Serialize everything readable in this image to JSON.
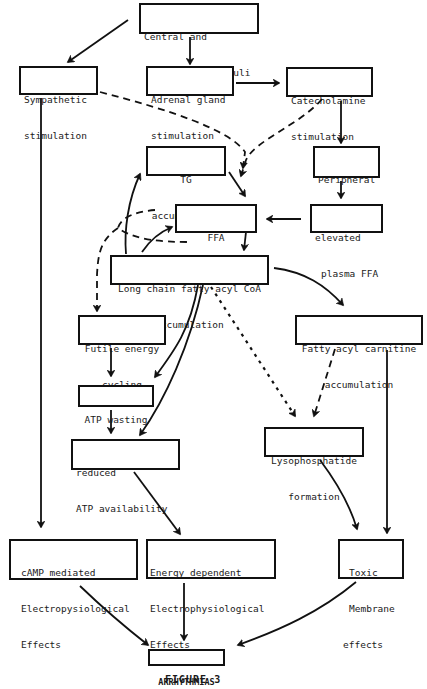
{
  "diagram": {
    "nodes": {
      "central": {
        "line1": "Central and",
        "line2": "Neurogenic Stimuli"
      },
      "sympathetic": {
        "line1": "Sympathetic",
        "line2": "stimulation"
      },
      "adrenal": {
        "line1": "Adrenal gland",
        "line2": "stimulation"
      },
      "catecholamine": {
        "line1": "Catecholamine",
        "line2": "stimulation"
      },
      "tg": {
        "line1": "TG",
        "line2": "accumulation"
      },
      "peripheral": {
        "line1": "Peripheral",
        "line2": "lipolysis"
      },
      "ffa": {
        "line1": "FFA",
        "line2": "accumulation"
      },
      "plasma_ffa": {
        "line1": "elevated",
        "line2": "plasma FFA"
      },
      "long_chain": {
        "line1": "Long chain fatty acyl CoA",
        "line2": "accumulation"
      },
      "futile": {
        "line1": "Futile energy",
        "line2": "cycling"
      },
      "carnitine": {
        "line1": "Fatty acyl carnitine",
        "line2": "accumulation"
      },
      "atp_wasting": {
        "line1": "ATP wasting"
      },
      "lyso": {
        "line1": "Lysophosphatide",
        "line2": "formation"
      },
      "reduced_atp": {
        "line1": "reduced",
        "line2": "ATP availability"
      },
      "camp": {
        "line1": "cAMP mediated",
        "line2": "Electropysiological",
        "line3": "Effects"
      },
      "energy_dep": {
        "line1": "Energy dependent",
        "line2": "Electrophysiological",
        "line3": "Effects"
      },
      "toxic": {
        "line1": "Toxic",
        "line2": "Membrane",
        "line3": "effects"
      },
      "arrhythmias": {
        "line1": "ARRHYTHMIAS"
      }
    },
    "edges": [
      {
        "from": "central",
        "to": "sympathetic",
        "style": "solid"
      },
      {
        "from": "central",
        "to": "adrenal",
        "style": "solid"
      },
      {
        "from": "adrenal",
        "to": "catecholamine",
        "style": "solid"
      },
      {
        "from": "sympathetic",
        "to": "ffa",
        "style": "dashed"
      },
      {
        "from": "catecholamine",
        "to": "ffa",
        "style": "dashed"
      },
      {
        "from": "catecholamine",
        "to": "peripheral",
        "style": "solid"
      },
      {
        "from": "peripheral",
        "to": "plasma_ffa",
        "style": "solid"
      },
      {
        "from": "plasma_ffa",
        "to": "ffa",
        "style": "solid"
      },
      {
        "from": "tg",
        "to": "ffa",
        "style": "solid"
      },
      {
        "from": "ffa",
        "to": "long_chain",
        "style": "solid"
      },
      {
        "from": "long_chain",
        "to": "tg",
        "style": "solid"
      },
      {
        "from": "long_chain",
        "to": "ffa",
        "style": "solid"
      },
      {
        "from": "ffa",
        "to": "futile",
        "style": "dashed"
      },
      {
        "from": "long_chain",
        "to": "carnitine",
        "style": "solid"
      },
      {
        "from": "long_chain",
        "to": "atp_wasting",
        "style": "solid"
      },
      {
        "from": "long_chain",
        "to": "reduced_atp",
        "style": "solid"
      },
      {
        "from": "long_chain",
        "to": "lyso",
        "style": "dotted"
      },
      {
        "from": "carnitine",
        "to": "lyso",
        "style": "dashed"
      },
      {
        "from": "futile",
        "to": "atp_wasting",
        "style": "solid"
      },
      {
        "from": "atp_wasting",
        "to": "reduced_atp",
        "style": "solid"
      },
      {
        "from": "sympathetic",
        "to": "camp",
        "style": "solid"
      },
      {
        "from": "reduced_atp",
        "to": "energy_dep",
        "style": "solid"
      },
      {
        "from": "lyso",
        "to": "toxic",
        "style": "solid"
      },
      {
        "from": "carnitine",
        "to": "toxic",
        "style": "solid"
      },
      {
        "from": "camp",
        "to": "arrhythmias",
        "style": "solid"
      },
      {
        "from": "energy_dep",
        "to": "arrhythmias",
        "style": "solid"
      },
      {
        "from": "toxic",
        "to": "arrhythmias",
        "style": "solid"
      }
    ]
  },
  "caption": "FIGURE 3"
}
